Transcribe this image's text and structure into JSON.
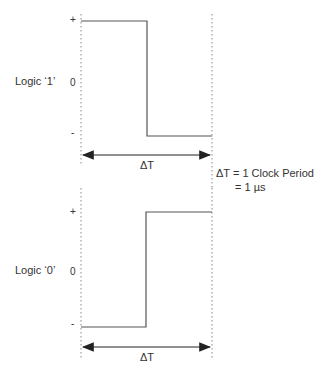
{
  "colors": {
    "signal": "#555555",
    "guide": "#888888",
    "text": "#333333"
  },
  "top": {
    "label": "Logic ‘1’",
    "ticks": {
      "plus": "+",
      "zero": "0",
      "minus": "-"
    },
    "delta_label": "ΔT"
  },
  "bottom": {
    "label": "Logic ‘0’",
    "ticks": {
      "plus": "+",
      "zero": "0",
      "minus": "-"
    },
    "delta_label": "ΔT"
  },
  "note": {
    "line1": "ΔT  = 1 Clock Period",
    "line2": "= 1 µs"
  }
}
